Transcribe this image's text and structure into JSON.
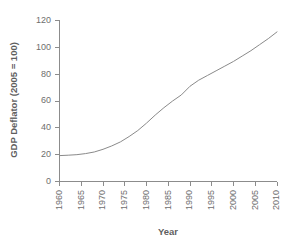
{
  "chart_data": {
    "type": "line",
    "title": "",
    "subtitle": "",
    "xlabel": "Year",
    "ylabel": "GDP Deflator (2005 = 100)",
    "xlim": [
      1960,
      2010
    ],
    "ylim": [
      0,
      120
    ],
    "grid": false,
    "legend": null,
    "legend_position": "none",
    "line_color": "#8a8a8a",
    "axis_color": "#8c8c8c",
    "text_color": "#6e6e6e",
    "background_color": "#ffffff",
    "xticks": [
      1960,
      1965,
      1970,
      1975,
      1980,
      1985,
      1990,
      1995,
      2000,
      2005,
      2010
    ],
    "xtick_labels": [
      "1960",
      "1965",
      "1970",
      "1975",
      "1980",
      "1985",
      "1990",
      "1995",
      "2000",
      "2005",
      "2010"
    ],
    "yticks": [
      0,
      20,
      40,
      60,
      80,
      100,
      120
    ],
    "ytick_labels": [
      "0",
      "20",
      "40",
      "60",
      "80",
      "100",
      "120"
    ],
    "series": [
      {
        "name": "GDP Deflator",
        "x": [
          1960,
          1962,
          1964,
          1966,
          1968,
          1970,
          1972,
          1974,
          1976,
          1978,
          1980,
          1982,
          1984,
          1986,
          1988,
          1990,
          1992,
          1994,
          1996,
          1998,
          2000,
          2002,
          2004,
          2006,
          2008,
          2010
        ],
        "values": [
          19.3,
          19.6,
          20.0,
          20.8,
          22.0,
          24.0,
          26.5,
          29.5,
          33.5,
          38.0,
          43.5,
          49.5,
          55.0,
          60.0,
          64.5,
          71.0,
          75.5,
          79.0,
          82.5,
          86.0,
          89.5,
          93.5,
          97.5,
          102.0,
          106.5,
          111.5
        ]
      }
    ]
  }
}
